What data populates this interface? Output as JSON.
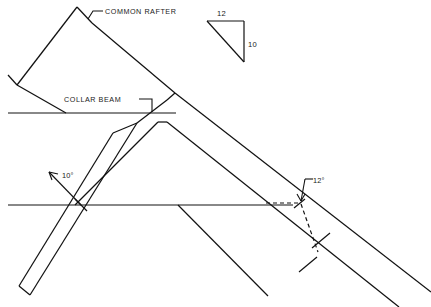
{
  "drawing": {
    "title": "Roof framing rafter layout detail",
    "canvas": {
      "width": 431,
      "height": 307,
      "background": "#ffffff"
    },
    "ink_color": "#121212",
    "labels": {
      "common_rafter": "COMMON RAFTER",
      "collar_beam": "COLLAR BEAM",
      "angle_left": "10°",
      "angle_right": "12°",
      "pitch_run": "12",
      "pitch_rise": "10"
    },
    "pitch_triangle": {
      "run_label": "12",
      "rise_label": "10",
      "apex_top_left": [
        207,
        21
      ],
      "apex_top_right": [
        244,
        21
      ],
      "apex_bottom_right": [
        244,
        62
      ]
    },
    "annotations": [
      {
        "name": "common-rafter",
        "text": "COMMON RAFTER",
        "x": 105,
        "y": 14
      },
      {
        "name": "collar-beam",
        "text": "COLLAR BEAM",
        "x": 64,
        "y": 102
      },
      {
        "name": "angle-10",
        "text": "10°",
        "x": 62,
        "y": 178
      },
      {
        "name": "angle-12",
        "text": "12°",
        "x": 311,
        "y": 184
      }
    ],
    "reference_lines": {
      "collar_beam_y": 113,
      "plate_line_y": 205,
      "collar_beam_x_start": 8,
      "collar_beam_x_end": 176,
      "plate_line_x_start": 8,
      "plate_line_x_end": 293,
      "dashed_plate_x_end": 301
    }
  }
}
